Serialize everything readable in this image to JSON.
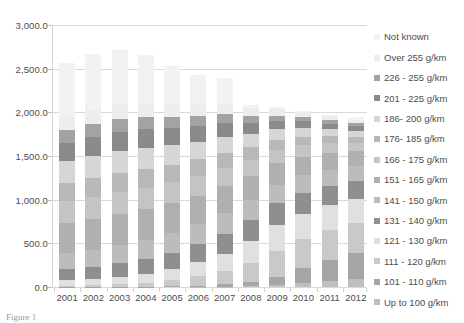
{
  "caption": "Figure 1",
  "chart_data": {
    "type": "bar",
    "subtype": "stacked-bar",
    "title": "",
    "xlabel": "",
    "ylabel": "",
    "ylim": [
      0,
      3000
    ],
    "ytick_step": 500,
    "grid": true,
    "legend_position": "right",
    "categories": [
      "2001",
      "2002",
      "2003",
      "2004",
      "2005",
      "2006",
      "2007",
      "2008",
      "2009",
      "2010",
      "2011",
      "2012"
    ],
    "ytick_labels": [
      "3,000.0",
      "2,500.0",
      "2,000.0",
      "1,500.0",
      "1,000.0",
      "500.0",
      "0.0"
    ],
    "ytick_values": [
      3000,
      2500,
      2000,
      1500,
      1000,
      500,
      0
    ],
    "series": [
      {
        "name": "Up to 100 g/km",
        "color": "#bfbfbf",
        "values": [
          0,
          0,
          0,
          0,
          0,
          2,
          4,
          9,
          22,
          48,
          70,
          95
        ]
      },
      {
        "name": "101 - 110 g/km",
        "color": "#a6a6a6",
        "values": [
          1,
          2,
          3,
          5,
          8,
          14,
          25,
          48,
          95,
          175,
          240,
          300
        ]
      },
      {
        "name": "111 - 120 g/km",
        "color": "#c9c9c9",
        "values": [
          14,
          20,
          30,
          45,
          70,
          105,
          150,
          215,
          300,
          330,
          345,
          340
        ]
      },
      {
        "name": "121 - 130 g/km",
        "color": "#e0e0e0",
        "values": [
          60,
          70,
          85,
          105,
          130,
          165,
          205,
          250,
          290,
          285,
          280,
          275
        ]
      },
      {
        "name": "131 - 140 g/km",
        "color": "#8f8f8f",
        "values": [
          130,
          140,
          155,
          170,
          185,
          205,
          225,
          245,
          250,
          240,
          225,
          210
        ]
      },
      {
        "name": "141 - 150 g/km",
        "color": "#bcbcbc",
        "values": [
          185,
          195,
          205,
          215,
          225,
          230,
          235,
          230,
          215,
          200,
          185,
          170
        ]
      },
      {
        "name": "151 - 165 g/km",
        "color": "#b0b0b0",
        "values": [
          340,
          350,
          355,
          350,
          340,
          325,
          310,
          280,
          245,
          215,
          190,
          165
        ]
      },
      {
        "name": "166 - 175 g/km",
        "color": "#c4c4c4",
        "values": [
          250,
          255,
          255,
          250,
          240,
          225,
          210,
          180,
          150,
          130,
          110,
          95
        ]
      },
      {
        "name": "176- 185 g/km",
        "color": "#b8b8b8",
        "values": [
          215,
          220,
          220,
          215,
          205,
          190,
          175,
          145,
          120,
          100,
          85,
          72
        ]
      },
      {
        "name": "186- 200 g/km",
        "color": "#d6d6d6",
        "values": [
          245,
          250,
          250,
          240,
          225,
          205,
          185,
          150,
          120,
          98,
          80,
          68
        ]
      },
      {
        "name": "201 - 225 g/km",
        "color": "#8a8a8a",
        "values": [
          215,
          220,
          220,
          210,
          195,
          175,
          155,
          122,
          95,
          76,
          62,
          52
        ]
      },
      {
        "name": "226 - 255 g/km",
        "color": "#a3a3a3",
        "values": [
          140,
          145,
          145,
          138,
          128,
          115,
          102,
          80,
          62,
          50,
          40,
          34
        ]
      },
      {
        "name": "Over 255 g/km",
        "color": "#ededed",
        "values": [
          160,
          165,
          165,
          158,
          146,
          132,
          117,
          92,
          72,
          58,
          47,
          40
        ]
      },
      {
        "name": "Not known",
        "color": "#f2f2f2",
        "values": [
          615,
          638,
          622,
          559,
          433,
          342,
          302,
          44,
          24,
          15,
          11,
          34
        ]
      }
    ]
  }
}
